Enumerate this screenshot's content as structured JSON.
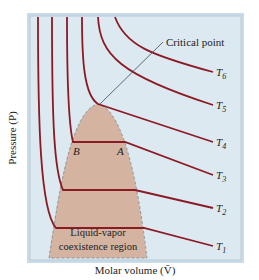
{
  "figure": {
    "type": "PV isotherm diagram",
    "x_axis_label": "Molar volume (V̄)",
    "y_axis_label": "Pressure (P)",
    "critical_point_label": "Critical point",
    "region_label_line1": "Liquid-vapor",
    "region_label_line2": "coexistence region",
    "point_labels": {
      "B": "B",
      "A": "A"
    },
    "isotherms": [
      {
        "name": "T",
        "sub": "1"
      },
      {
        "name": "T",
        "sub": "2"
      },
      {
        "name": "T",
        "sub": "3"
      },
      {
        "name": "T",
        "sub": "4"
      },
      {
        "name": "T",
        "sub": "5"
      },
      {
        "name": "T",
        "sub": "6"
      }
    ],
    "colors": {
      "background": "#dde9f1",
      "frame": "#b7cbd9",
      "isotherm": "#8b1a24",
      "dome_fill": "#d4b3a0",
      "leader_line": "#3a4a58"
    }
  }
}
